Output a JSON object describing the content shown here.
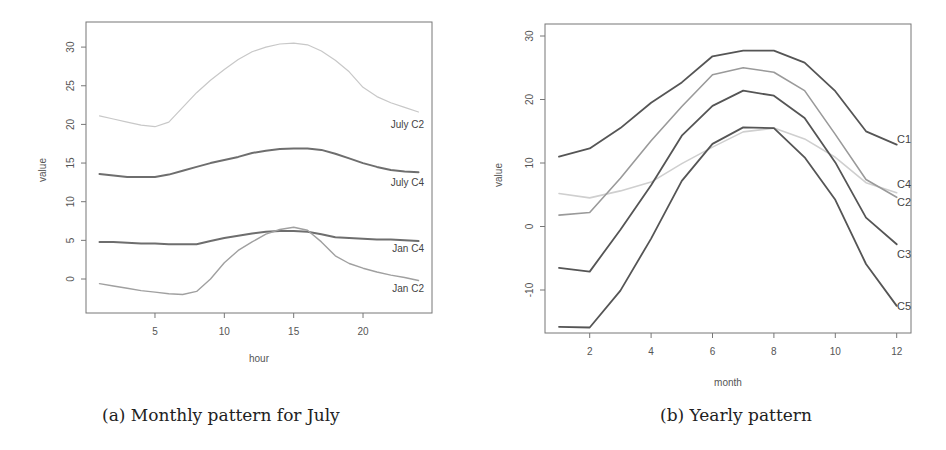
{
  "captions": {
    "a": "(a) Monthly pattern for July",
    "b": "(b) Yearly pattern"
  },
  "chart_data": [
    {
      "id": "a",
      "type": "line",
      "title": "",
      "caption": "(a) Monthly pattern for July",
      "xlabel": "hour",
      "ylabel": "value",
      "xticks": [
        5,
        10,
        15,
        20
      ],
      "yticks": [
        0,
        5,
        10,
        15,
        20,
        25,
        30
      ],
      "xlim": [
        0,
        25
      ],
      "ylim": [
        -4.5,
        33.5
      ],
      "grid": false,
      "legend": "inline labels at right end",
      "x": [
        1,
        2,
        3,
        4,
        5,
        6,
        7,
        8,
        9,
        10,
        11,
        12,
        13,
        14,
        15,
        16,
        17,
        18,
        19,
        20,
        21,
        22,
        23,
        24
      ],
      "series": [
        {
          "name": "July C2",
          "color": "#c8c8c8",
          "width": 1.2,
          "values": [
            21.1,
            20.7,
            20.3,
            19.9,
            19.7,
            20.3,
            22.2,
            24.1,
            25.7,
            27.1,
            28.4,
            29.4,
            30.0,
            30.4,
            30.5,
            30.3,
            29.5,
            28.3,
            26.8,
            24.8,
            23.6,
            22.8,
            22.2,
            21.6
          ]
        },
        {
          "name": "July C4",
          "color": "#6e6e6e",
          "width": 2.0,
          "values": [
            13.6,
            13.4,
            13.2,
            13.2,
            13.2,
            13.5,
            14.0,
            14.5,
            15.0,
            15.4,
            15.8,
            16.3,
            16.6,
            16.8,
            16.9,
            16.9,
            16.7,
            16.2,
            15.6,
            15.0,
            14.5,
            14.1,
            13.9,
            13.8
          ]
        },
        {
          "name": "Jan C4",
          "color": "#6e6e6e",
          "width": 2.0,
          "values": [
            4.8,
            4.8,
            4.7,
            4.6,
            4.6,
            4.5,
            4.5,
            4.5,
            4.9,
            5.3,
            5.6,
            5.9,
            6.1,
            6.2,
            6.2,
            6.1,
            5.8,
            5.4,
            5.3,
            5.2,
            5.1,
            5.1,
            5.0,
            4.9
          ]
        },
        {
          "name": "Jan C2",
          "color": "#a0a0a0",
          "width": 1.4,
          "values": [
            -0.6,
            -0.9,
            -1.2,
            -1.5,
            -1.7,
            -1.9,
            -2.0,
            -1.6,
            0.0,
            2.1,
            3.7,
            4.8,
            5.8,
            6.4,
            6.7,
            6.3,
            4.8,
            3.0,
            2.0,
            1.4,
            0.9,
            0.5,
            0.2,
            -0.2
          ]
        }
      ]
    },
    {
      "id": "b",
      "type": "line",
      "title": "",
      "caption": "(b) Yearly pattern",
      "xlabel": "month",
      "ylabel": "value",
      "xticks": [
        2,
        4,
        6,
        8,
        10,
        12
      ],
      "yticks": [
        -10,
        0,
        10,
        20,
        30
      ],
      "xlim": [
        0.55,
        12.45
      ],
      "ylim": [
        -17,
        32
      ],
      "grid": false,
      "legend": "inline labels at right end",
      "x": [
        1,
        2,
        3,
        4,
        5,
        6,
        7,
        8,
        9,
        10,
        11,
        12
      ],
      "series": [
        {
          "name": "C1",
          "color": "#555555",
          "width": 1.8,
          "values": [
            11.0,
            12.3,
            15.5,
            19.5,
            22.7,
            26.8,
            27.7,
            27.7,
            25.8,
            21.3,
            15.0,
            12.9
          ]
        },
        {
          "name": "C4",
          "color": "#cfcfcf",
          "width": 1.6,
          "values": [
            5.2,
            4.5,
            5.6,
            7.0,
            9.9,
            12.5,
            14.9,
            15.5,
            13.8,
            10.9,
            6.9,
            5.3
          ]
        },
        {
          "name": "C2",
          "color": "#9a9a9a",
          "width": 1.6,
          "values": [
            1.8,
            2.2,
            7.6,
            13.5,
            18.9,
            23.9,
            25.0,
            24.3,
            21.4,
            14.5,
            7.4,
            4.6
          ]
        },
        {
          "name": "C3",
          "color": "#555555",
          "width": 1.8,
          "values": [
            -6.5,
            -7.1,
            -0.5,
            6.5,
            14.3,
            19.0,
            21.4,
            20.6,
            17.1,
            10.1,
            1.4,
            -2.8
          ]
        },
        {
          "name": "C5",
          "color": "#555555",
          "width": 1.8,
          "values": [
            -15.8,
            -15.9,
            -10.1,
            -1.9,
            7.2,
            13.0,
            15.6,
            15.5,
            10.9,
            4.2,
            -5.9,
            -12.5
          ]
        }
      ]
    }
  ]
}
